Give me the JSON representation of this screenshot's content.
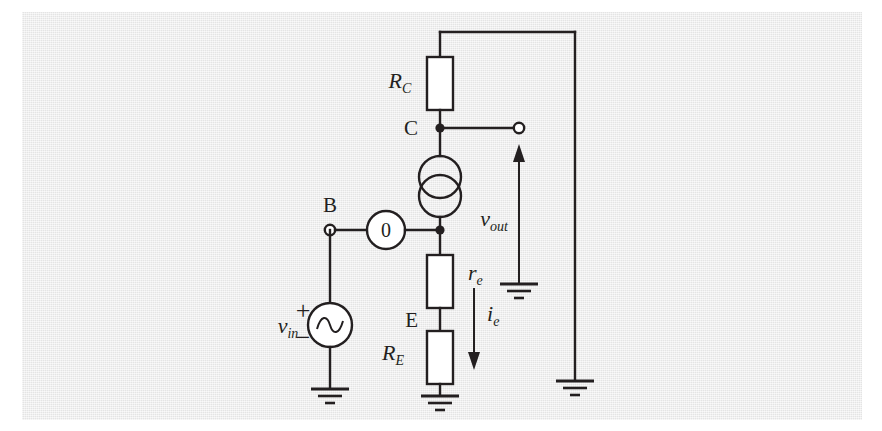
{
  "figure": {
    "kind": "circuit-schematic",
    "panel_color": "#e8e8e8",
    "ink_color": "#231f20",
    "component_fill": "#ffffff",
    "page_background": "#ffffff"
  },
  "nodes": [
    {
      "id": "C",
      "label": "C",
      "type": "junction",
      "x": 440,
      "y": 128
    },
    {
      "id": "B",
      "label": "B",
      "type": "open-terminal",
      "x": 330,
      "y": 230
    },
    {
      "id": "E",
      "label": "E",
      "type": "plain",
      "x": 440,
      "y": 320
    },
    {
      "id": "OUT",
      "label": "",
      "type": "open-terminal",
      "x": 519,
      "y": 128
    },
    {
      "id": "MID",
      "label": "",
      "type": "junction",
      "x": 440,
      "y": 230
    }
  ],
  "components": [
    {
      "id": "RC",
      "kind": "resistor",
      "label": "R",
      "sub": "C",
      "label_x": 400,
      "label_y": 88,
      "orientation": "vertical"
    },
    {
      "id": "CCS",
      "kind": "controlled-current-source",
      "label": "",
      "sub": "",
      "symbol": "two-overlapping-circles",
      "orientation": "vertical"
    },
    {
      "id": "ZERO",
      "kind": "zero-source",
      "label": "0",
      "sub": "",
      "symbol": "circle-with-zero",
      "orientation": "horizontal"
    },
    {
      "id": "RE_SMALL",
      "kind": "resistor",
      "label": "r",
      "sub": "e",
      "label_x": 468,
      "label_y": 277,
      "orientation": "vertical"
    },
    {
      "id": "RE_BIG",
      "kind": "resistor",
      "label": "R",
      "sub": "E",
      "label_x": 393,
      "label_y": 357,
      "orientation": "vertical"
    },
    {
      "id": "VIN",
      "kind": "ac-voltage-source",
      "label": "v",
      "sub": "in",
      "symbol": "circle-with-sine",
      "plus": "+",
      "minus": "−",
      "orientation": "vertical"
    }
  ],
  "measurements": [
    {
      "id": "VOUT",
      "label": "v",
      "sub": "out",
      "kind": "voltage-arrow",
      "direction": "up",
      "label_x": 508,
      "label_y": 222
    },
    {
      "id": "IE",
      "label": "i",
      "sub": "e",
      "kind": "current-arrow",
      "direction": "down",
      "label_x": 478,
      "label_y": 318
    }
  ],
  "grounds": [
    {
      "id": "gnd-vin",
      "x": 295,
      "y": 388
    },
    {
      "id": "gnd-re",
      "x": 440,
      "y": 395
    },
    {
      "id": "gnd-vout-ref",
      "x": 519,
      "y": 288
    },
    {
      "id": "gnd-supply",
      "x": 575,
      "y": 393
    }
  ],
  "labels": {
    "node_c": "C",
    "node_b": "B",
    "node_e": "E",
    "rc_main": "R",
    "rc_sub": "C",
    "re_small_main": "r",
    "re_small_sub": "e",
    "re_big_main": "R",
    "re_big_sub": "E",
    "vin_main": "v",
    "vin_sub": "in",
    "vin_plus": "+",
    "vin_minus": "−",
    "vout_main": "v",
    "vout_sub": "out",
    "ie_main": "i",
    "ie_sub": "e",
    "zero_value": "0"
  }
}
